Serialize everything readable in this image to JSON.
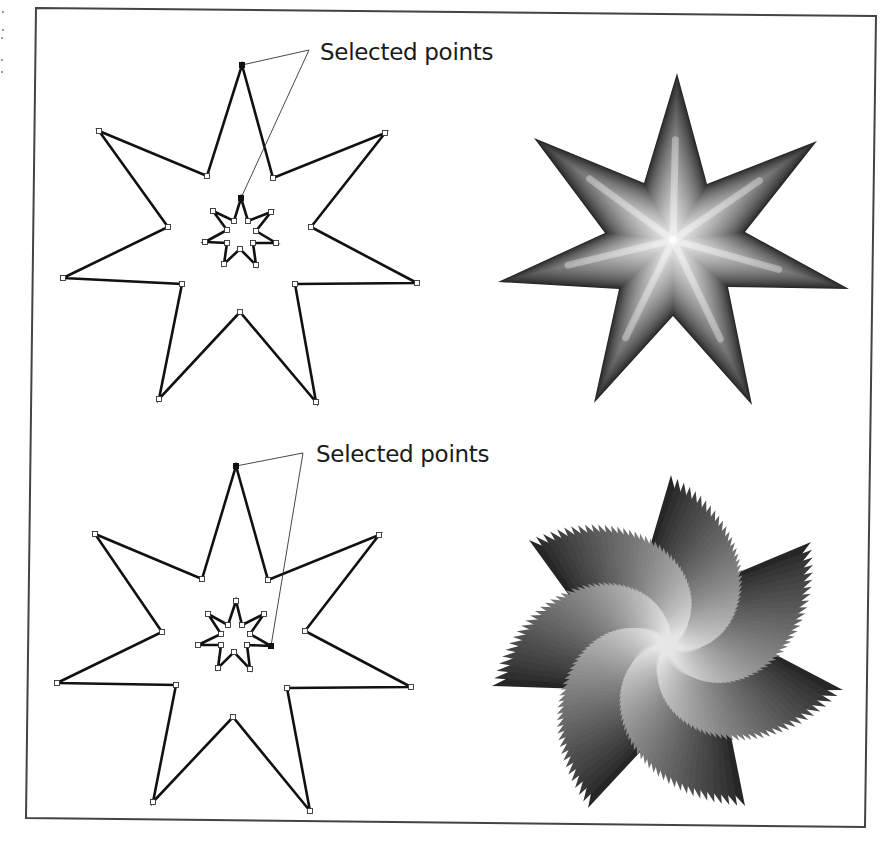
{
  "figure": {
    "frame": {
      "points": [
        [
          36,
          8
        ],
        [
          876,
          16
        ],
        [
          865,
          827
        ],
        [
          26,
          818
        ]
      ],
      "color": "#444444"
    },
    "panels": [
      {
        "id": "top",
        "caption": "Selected points",
        "caption_pos": [
          320,
          60
        ],
        "outline_star": {
          "outer": [
            [
              242,
              65
            ],
            [
              385,
              133
            ],
            [
              417,
              283
            ],
            [
              316,
              402
            ],
            [
              159,
              399
            ],
            [
              63,
              278
            ],
            [
              99,
              131
            ]
          ],
          "inner": [
            [
              273,
              178
            ],
            [
              311,
              227
            ],
            [
              295,
              284
            ],
            [
              240,
              312
            ],
            [
              182,
              284
            ],
            [
              168,
              227
            ],
            [
              207,
              176
            ]
          ]
        },
        "small_star": {
          "outer": [
            [
              241,
              198
            ],
            [
              271,
              212
            ],
            [
              276,
              243
            ],
            [
              256,
              265
            ],
            [
              224,
              264
            ],
            [
              205,
              242
            ],
            [
              213,
              211
            ]
          ],
          "inner": [
            [
              248,
              221
            ],
            [
              256,
              231
            ],
            [
              253,
              243
            ],
            [
              240,
              249
            ],
            [
              227,
              243
            ],
            [
              227,
              230
            ],
            [
              234,
              221
            ]
          ]
        },
        "selected_points": [
          [
            242,
            65
          ],
          [
            241,
            198
          ]
        ],
        "leader": [
          [
            242,
            65
          ],
          [
            309,
            50
          ],
          [
            241,
            198
          ]
        ],
        "blend_star": {
          "outer": [
            [
              677,
              73
            ],
            [
              817,
              141
            ],
            [
              849,
              289
            ],
            [
              752,
              405
            ],
            [
              594,
              403
            ],
            [
              498,
              282
            ],
            [
              534,
              138
            ]
          ],
          "inner": [
            [
              707,
              184
            ],
            [
              745,
              232
            ],
            [
              728,
              287
            ],
            [
              673,
              316
            ],
            [
              619,
              289
            ],
            [
              605,
              233
            ],
            [
              644,
              183
            ]
          ],
          "center": [
            673,
            240
          ],
          "twist_deg": 0,
          "color_dark": "#262626",
          "color_light": "#e2e2e2"
        }
      },
      {
        "id": "bottom",
        "caption": "Selected points",
        "caption_pos": [
          316,
          462
        ],
        "outline_star": {
          "outer": [
            [
              236,
              466
            ],
            [
              379,
              535
            ],
            [
              411,
              687
            ],
            [
              310,
              811
            ],
            [
              153,
              802
            ],
            [
              57,
              683
            ],
            [
              95,
              534
            ]
          ],
          "inner": [
            [
              268,
              580
            ],
            [
              305,
              631
            ],
            [
              287,
              688
            ],
            [
              233,
              717
            ],
            [
              176,
              685
            ],
            [
              162,
              632
            ],
            [
              202,
              579
            ]
          ]
        },
        "small_star": {
          "outer": [
            [
              271,
              646
            ],
            [
              250,
              669
            ],
            [
              218,
              668
            ],
            [
              198,
              645
            ],
            [
              208,
              614
            ],
            [
              236,
              601
            ],
            [
              264,
              614
            ]
          ],
          "inner": [
            [
              247,
              645
            ],
            [
              234,
              652
            ],
            [
              221,
              645
            ],
            [
              221,
              634
            ],
            [
              228,
              625
            ],
            [
              242,
              625
            ],
            [
              250,
              634
            ]
          ]
        },
        "selected_points": [
          [
            236,
            466
          ],
          [
            271,
            646
          ]
        ],
        "leader": [
          [
            236,
            466
          ],
          [
            303,
            453
          ],
          [
            271,
            646
          ]
        ],
        "blend_star": {
          "outer": [
            [
              671,
              475
            ],
            [
              811,
              542
            ],
            [
              843,
              690
            ],
            [
              745,
              806
            ],
            [
              588,
              808
            ],
            [
              492,
              686
            ],
            [
              529,
              540
            ]
          ],
          "inner": [
            [
              701,
              588
            ],
            [
              740,
              636
            ],
            [
              722,
              691
            ],
            [
              668,
              722
            ],
            [
              612,
              690
            ],
            [
              597,
              634
            ],
            [
              638,
              587
            ]
          ],
          "center": [
            668,
            645
          ],
          "twist_deg": 103,
          "color_dark": "#262626",
          "color_light": "#e6e6e6"
        }
      }
    ],
    "margin_marks": [
      [
        3,
        12
      ],
      [
        3,
        30
      ],
      [
        2,
        38
      ],
      [
        2,
        60
      ],
      [
        2,
        72
      ]
    ]
  }
}
